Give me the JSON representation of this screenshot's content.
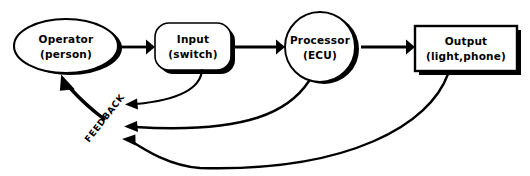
{
  "diagram": {
    "background_color": "#ffffff",
    "line_color": "#000000",
    "nodes": [
      {
        "id": "operator",
        "shape": "ellipse",
        "line1": "Operator",
        "line2": "(person)",
        "cx": 66,
        "cy": 46,
        "rx": 52,
        "ry": 27
      },
      {
        "id": "input",
        "shape": "rounded-rectangle",
        "line1": "Input",
        "line2": "(switch)",
        "x": 155,
        "y": 23,
        "w": 76,
        "h": 47
      },
      {
        "id": "processor",
        "shape": "circle",
        "line1": "Processor",
        "line2": "(ECU)",
        "cx": 320,
        "cy": 47,
        "r": 35
      },
      {
        "id": "output",
        "shape": "rectangle",
        "line1": "Output",
        "line2": "(light,phone)",
        "x": 415,
        "y": 26,
        "w": 102,
        "h": 45
      }
    ],
    "forward_arrows": [
      {
        "id": "operator-to-input",
        "from": "operator",
        "to": "input"
      },
      {
        "id": "input-to-processor",
        "from": "input",
        "to": "processor"
      },
      {
        "id": "processor-to-output",
        "from": "processor",
        "to": "output"
      }
    ],
    "feedback": {
      "label": "FEEDBACK",
      "label_rotation_deg": -52,
      "label_x": 107,
      "label_y": 120,
      "return_arrow": {
        "id": "feedback-to-operator",
        "to": "operator"
      },
      "incoming": [
        {
          "id": "feedback-from-input",
          "from": "input"
        },
        {
          "id": "feedback-from-processor",
          "from": "processor"
        },
        {
          "id": "feedback-from-output",
          "from": "output"
        }
      ]
    }
  }
}
